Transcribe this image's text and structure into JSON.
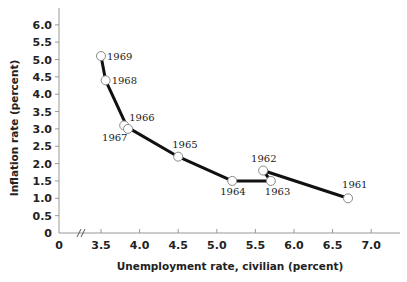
{
  "chart_data": {
    "type": "line",
    "title": "",
    "xlabel": "Unemployment rate, civilian (percent)",
    "ylabel": "Inflation rate (percent)",
    "xlim": [
      3.0,
      7.4
    ],
    "ylim": [
      0,
      6.3
    ],
    "x_ticks": [
      "0",
      "3.5",
      "4.0",
      "4.5",
      "5.0",
      "5.5",
      "6.0",
      "6.5",
      "7.0"
    ],
    "y_ticks": [
      "0",
      "0.5",
      "1.0",
      "1.5",
      "2.0",
      "2.5",
      "3.0",
      "3.5",
      "4.0",
      "4.5",
      "5.0",
      "5.5",
      "6.0"
    ],
    "axis_break": true,
    "grid": false,
    "legend": "none",
    "series": [
      {
        "name": "Phillips curve 1961-1969",
        "points": [
          {
            "year": "1961",
            "x": 6.7,
            "y": 1.0
          },
          {
            "year": "1962",
            "x": 5.6,
            "y": 1.8
          },
          {
            "year": "1963",
            "x": 5.7,
            "y": 1.5
          },
          {
            "year": "1964",
            "x": 5.2,
            "y": 1.5
          },
          {
            "year": "1965",
            "x": 4.5,
            "y": 2.2
          },
          {
            "year": "1966",
            "x": 3.8,
            "y": 3.1
          },
          {
            "year": "1967",
            "x": 3.85,
            "y": 3.0
          },
          {
            "year": "1968",
            "x": 3.56,
            "y": 4.4
          },
          {
            "year": "1969",
            "x": 3.5,
            "y": 5.1
          }
        ]
      }
    ]
  }
}
